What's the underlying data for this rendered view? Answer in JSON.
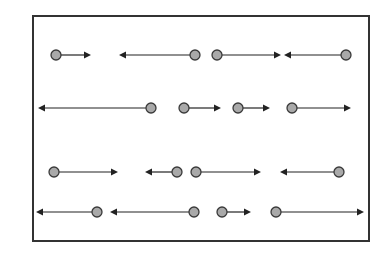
{
  "diagram": {
    "background": "#ffffff",
    "frame": {
      "x1": 33,
      "y1": 16,
      "x2": 369,
      "y2": 241,
      "stroke": "#333333",
      "stroke_width": 2
    },
    "dot_style": {
      "radius": 5,
      "fill": "#a9a9a9",
      "stroke": "#3a3a3a",
      "stroke_width": 1.3
    },
    "arrow_style": {
      "stroke": "#222222",
      "stroke_width": 1.2,
      "head_length": 7,
      "head_half_width": 3.5
    },
    "rows": [
      {
        "y": 55,
        "particles": [
          {
            "x": 56,
            "direction": "right",
            "tip_x": 91
          },
          {
            "x": 195,
            "direction": "left",
            "tip_x": 119
          },
          {
            "x": 217,
            "direction": "right",
            "tip_x": 281
          },
          {
            "x": 346,
            "direction": "left",
            "tip_x": 284
          }
        ]
      },
      {
        "y": 108,
        "particles": [
          {
            "x": 151,
            "direction": "left",
            "tip_x": 38
          },
          {
            "x": 184,
            "direction": "right",
            "tip_x": 221
          },
          {
            "x": 238,
            "direction": "right",
            "tip_x": 270
          },
          {
            "x": 292,
            "direction": "right",
            "tip_x": 351
          }
        ]
      },
      {
        "y": 172,
        "particles": [
          {
            "x": 54,
            "direction": "right",
            "tip_x": 118
          },
          {
            "x": 177,
            "direction": "left",
            "tip_x": 145
          },
          {
            "x": 196,
            "direction": "right",
            "tip_x": 261
          },
          {
            "x": 339,
            "direction": "left",
            "tip_x": 280
          }
        ]
      },
      {
        "y": 212,
        "particles": [
          {
            "x": 97,
            "direction": "left",
            "tip_x": 36
          },
          {
            "x": 194,
            "direction": "left",
            "tip_x": 110
          },
          {
            "x": 222,
            "direction": "right",
            "tip_x": 251
          },
          {
            "x": 276,
            "direction": "right",
            "tip_x": 364
          }
        ]
      }
    ]
  }
}
